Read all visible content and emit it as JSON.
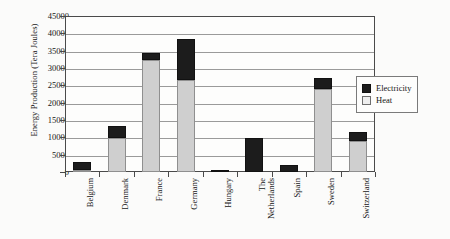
{
  "chart_data": {
    "type": "bar",
    "subtype": "stacked-vertical-bar",
    "title": "",
    "xlabel": "",
    "ylabel": "Energy Production (Tera Joules)",
    "ylim": [
      0,
      45000
    ],
    "ytick_step": 5000,
    "ytick_labels": [
      "0",
      "5000",
      "10000",
      "15000",
      "20000",
      "25000",
      "30000",
      "35000",
      "40000",
      "45000"
    ],
    "ytick_values": [
      0,
      5000,
      10000,
      15000,
      20000,
      25000,
      30000,
      35000,
      40000,
      45000
    ],
    "grid": "horizontal",
    "legend_position": "right",
    "categories": [
      "Belgium",
      "Denmark",
      "France",
      "Germany",
      "Hungary",
      "The Netherlands",
      "Spain",
      "Sweden",
      "Switzerland"
    ],
    "category_lines": [
      [
        "Belgium"
      ],
      [
        "Denmark"
      ],
      [
        "France"
      ],
      [
        "Germany"
      ],
      [
        "Hungary"
      ],
      [
        "The",
        "Netherlands"
      ],
      [
        "Spain"
      ],
      [
        "Sweden"
      ],
      [
        "Switzerland"
      ]
    ],
    "series": [
      {
        "name": "Heat",
        "color": "#cfcfcf",
        "values": [
          300,
          9900,
          32200,
          26500,
          0,
          0,
          0,
          24000,
          9000
        ]
      },
      {
        "name": "Electricity",
        "color": "#1c1c1c",
        "values": [
          2300,
          3500,
          2000,
          11800,
          400,
          9900,
          1900,
          3200,
          2500
        ]
      }
    ],
    "totals": [
      2600,
      13400,
      34200,
      38300,
      400,
      9900,
      1900,
      27200,
      11500
    ],
    "stack_order_bottom_to_top": [
      "Heat",
      "Electricity"
    ]
  },
  "legend": {
    "entries": [
      {
        "label": "Electricity",
        "swatch": "black-square"
      },
      {
        "label": "Heat",
        "swatch": "white-square"
      }
    ]
  }
}
